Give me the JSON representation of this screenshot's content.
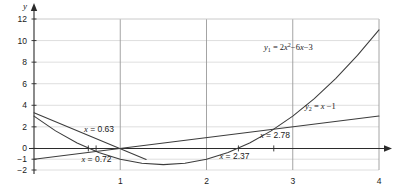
{
  "chart_data": {
    "type": "line",
    "title": "",
    "xlabel": "x",
    "ylabel": "y",
    "xlim": [
      0,
      4
    ],
    "ylim": [
      -2,
      12
    ],
    "grid": true,
    "legend_position": "inline-annotations",
    "x_ticks": [
      "1",
      "2",
      "3",
      "4"
    ],
    "x_tick_values": [
      1,
      2,
      3,
      4
    ],
    "y_ticks": [
      "12",
      "10",
      "8",
      "6",
      "4",
      "2",
      "0",
      "-1",
      "-2"
    ],
    "y_tick_values": [
      12,
      10,
      8,
      6,
      4,
      2,
      0,
      -1,
      -2
    ],
    "series": [
      {
        "name": "y1",
        "label_parts": {
          "lhs": "y",
          "sub": "1",
          "eq": "=",
          "rhs_a": "2",
          "rhs_x": "x",
          "rhs_pow": "2",
          "rhs_b": "−6",
          "rhs_x2": "x",
          "rhs_c": "−3"
        },
        "label_text": "y1 = 2x2 −6x −3",
        "type": "quadratic",
        "coefficients": {
          "a": 2,
          "b": -6,
          "c": 3
        },
        "points": [
          {
            "x": 0.0,
            "y": 3.0
          },
          {
            "x": 0.25,
            "y": 1.625
          },
          {
            "x": 0.5,
            "y": 0.5
          },
          {
            "x": 0.75,
            "y": -0.375
          },
          {
            "x": 1.0,
            "y": -1.0
          },
          {
            "x": 1.25,
            "y": -1.375
          },
          {
            "x": 1.5,
            "y": -1.5
          },
          {
            "x": 1.75,
            "y": -1.375
          },
          {
            "x": 2.0,
            "y": -1.0
          },
          {
            "x": 2.25,
            "y": -0.375
          },
          {
            "x": 2.5,
            "y": 0.5
          },
          {
            "x": 2.75,
            "y": 1.625
          },
          {
            "x": 3.0,
            "y": 3.0
          },
          {
            "x": 3.25,
            "y": 4.625
          },
          {
            "x": 3.5,
            "y": 6.5
          },
          {
            "x": 3.75,
            "y": 8.625
          },
          {
            "x": 4.0,
            "y": 11.0
          }
        ]
      },
      {
        "name": "y2",
        "label_parts": {
          "lhs": "y",
          "sub": "2",
          "eq": "=",
          "rhs_x": "x",
          "rhs_c": "−1"
        },
        "label_text": "y2 = x −1",
        "type": "linear",
        "coefficients": {
          "m": 1,
          "b": -1
        },
        "points": [
          {
            "x": 0.0,
            "y": -1.0
          },
          {
            "x": 4.0,
            "y": 3.0
          }
        ]
      },
      {
        "name": "y3",
        "label_text": "",
        "type": "linear-descending",
        "coefficients": {
          "m": -3.33,
          "b": 3.3
        },
        "points": [
          {
            "x": 0.0,
            "y": 3.3
          },
          {
            "x": 1.3,
            "y": -1.03
          }
        ]
      }
    ],
    "annotations": [
      {
        "id": "ann-063",
        "prefix": "x",
        "eq": " = ",
        "value": "0.63",
        "text": "x = 0.63",
        "x": 0.63,
        "y": 0.0,
        "label_x": 0.58,
        "label_y": 1.55,
        "tick": true
      },
      {
        "id": "ann-072",
        "prefix": "x",
        "eq": " = ",
        "value": "0.72",
        "text": "x = 0.72",
        "x": 0.72,
        "y": 0.0,
        "label_x": 0.55,
        "label_y": -1.25,
        "tick": true
      },
      {
        "id": "ann-237",
        "prefix": "x",
        "eq": " = ",
        "value": "2.37",
        "text": "x = 2.37",
        "x": 2.37,
        "y": 0.0,
        "label_x": 2.15,
        "label_y": -1.0,
        "tick": true
      },
      {
        "id": "ann-278",
        "prefix": "x",
        "eq": " = ",
        "value": "2.78",
        "text": "x = 2.78",
        "x": 2.78,
        "y": 0.0,
        "label_x": 2.62,
        "label_y": 0.95,
        "tick": true
      }
    ],
    "colors": {
      "curve": "#3c3c3c",
      "axis": "#2b2b2b",
      "grid_major": "#9a9a9a",
      "grid_minor": "#d5d5d5",
      "text": "#1a1a1a",
      "background": "#ffffff"
    }
  }
}
